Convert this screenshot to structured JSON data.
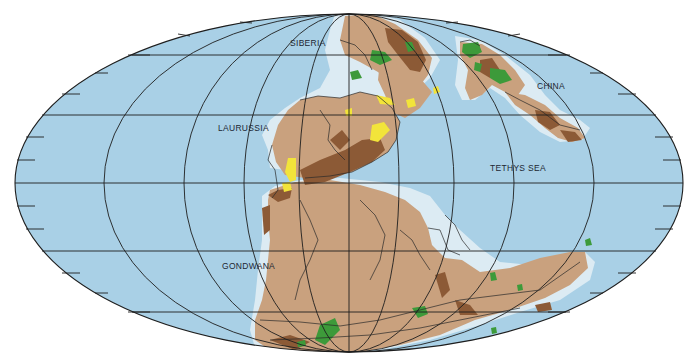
{
  "map": {
    "projection": "mollweide",
    "colors": {
      "ocean": "#a9d0e6",
      "shelf": "#dcebf3",
      "lowland": "#c9a17e",
      "highland": "#8c5a36",
      "forest": "#3d9a3a",
      "desert": "#f2e43a",
      "grid": "#1e1e1e",
      "background": "#ffffff"
    },
    "labels": [
      {
        "id": "siberia",
        "text": "SIBERIA"
      },
      {
        "id": "laurussia",
        "text": "LAURUSSIA"
      },
      {
        "id": "china",
        "text": "CHINA"
      },
      {
        "id": "tethys-sea",
        "text": "TETHYS SEA"
      },
      {
        "id": "gondwana",
        "text": "GONDWANA"
      }
    ]
  }
}
